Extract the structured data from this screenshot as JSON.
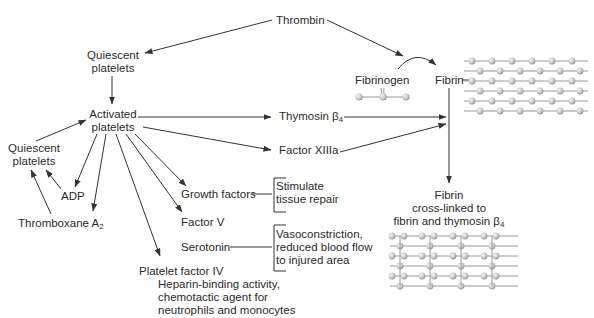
{
  "diagram": {
    "colors": {
      "line": "#333333",
      "text": "#2b2b2b",
      "bead": "#c8c8c8",
      "bead_highlight": "#f4f4f4",
      "lattice_line": "#9a9a9a"
    },
    "nodes": {
      "thrombin": "Thrombin",
      "quiescent_top_1": "Quiescent",
      "quiescent_top_2": "platelets",
      "activated_1": "Activated",
      "activated_2": "platelets",
      "quiescent_left_1": "Quiescent",
      "quiescent_left_2": "platelets",
      "adp": "ADP",
      "thromboxane": "Thromboxane A",
      "thromboxane_sub": "2",
      "thymosin": "Thymosin β",
      "thymosin_sub": "4",
      "factor_xiiia": "Factor XIIIa",
      "growth_factors": "Growth factors",
      "factor_v": "Factor V",
      "serotonin": "Serotonin",
      "platelet_factor_iv": "Platelet factor IV",
      "pf4_desc_1": "Heparin-binding activity,",
      "pf4_desc_2": "chemotactic agent for",
      "pf4_desc_3": "neutrophils and monocytes",
      "growth_desc_1": "Stimulate",
      "growth_desc_2": "tissue repair",
      "serotonin_desc_1": "Vasoconstriction,",
      "serotonin_desc_2": "reduced blood flow",
      "serotonin_desc_3": "to injured area",
      "fibrinogen": "Fibrinogen",
      "fibrin": "Fibrin",
      "crosslinked_1": "Fibrin",
      "crosslinked_2": "cross-linked to",
      "crosslinked_3": "fibrin and thymosin β",
      "crosslinked_sub": "4"
    },
    "edges": [
      {
        "from": "Thrombin",
        "to": "Quiescent platelets"
      },
      {
        "from": "Thrombin",
        "to": "Fibrinogen→Fibrin conversion"
      },
      {
        "from": "Fibrinogen",
        "to": "Fibrin"
      },
      {
        "from": "Quiescent platelets",
        "to": "Activated platelets"
      },
      {
        "from": "Quiescent platelets (left)",
        "to": "Activated platelets"
      },
      {
        "from": "Activated platelets",
        "to": "ADP"
      },
      {
        "from": "Activated platelets",
        "to": "Thromboxane A2"
      },
      {
        "from": "ADP",
        "to": "Quiescent platelets (left)"
      },
      {
        "from": "Thromboxane A2",
        "to": "Quiescent platelets (left)"
      },
      {
        "from": "Activated platelets",
        "to": "Platelet factor IV"
      },
      {
        "from": "Activated platelets",
        "to": "Factor V"
      },
      {
        "from": "Activated platelets",
        "to": "Growth factors"
      },
      {
        "from": "Activated platelets",
        "to": "Thymosin β4"
      },
      {
        "from": "Activated platelets",
        "to": "Factor XIIIa"
      },
      {
        "from": "Thymosin β4",
        "to": "Fibrin"
      },
      {
        "from": "Factor XIIIa",
        "to": "Fibrin"
      },
      {
        "from": "Fibrin",
        "to": "Fibrin cross-linked to fibrin and thymosin β4"
      }
    ]
  }
}
